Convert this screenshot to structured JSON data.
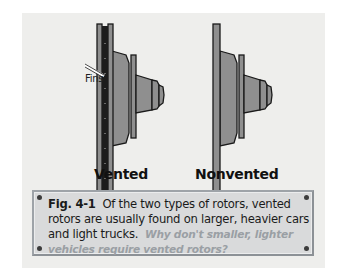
{
  "figure": {
    "callout_label": "Fins",
    "left_label": "Vented",
    "right_label": "Nonvented",
    "colors": {
      "background": "#eeeeec",
      "rotor_fill": "#8f8f8f",
      "outline": "#1a1a1a",
      "fins": "#222222"
    }
  },
  "caption": {
    "figure_number": "Fig. 4-1",
    "text": "Of the two types of rotors, vented rotors are usually found on larger, heavier cars and light trucks.",
    "question": "Why don't smaller, lighter vehicles require vented rotors?",
    "colors": {
      "box": "#d9dadb",
      "border": "#9ea3a8",
      "question": "#9a9fa4"
    }
  }
}
